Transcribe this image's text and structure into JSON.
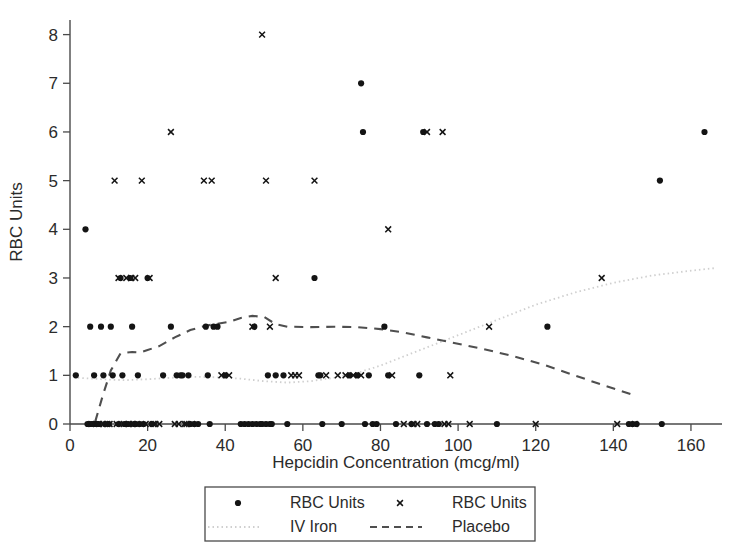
{
  "chart_data": {
    "type": "scatter",
    "title": "",
    "xlabel": "Hepcidin Concentration (mcg/ml)",
    "ylabel": "RBC Units",
    "xlim": [
      0,
      168
    ],
    "ylim": [
      0,
      8.3
    ],
    "xticks": [
      0,
      20,
      40,
      60,
      80,
      100,
      120,
      140,
      160
    ],
    "yticks": [
      0,
      1,
      2,
      3,
      4,
      5,
      6,
      7,
      8
    ],
    "grid": false,
    "legend_position": "below-center",
    "legend": [
      {
        "label": "RBC Units",
        "marker": "dot"
      },
      {
        "label": "RBC Units",
        "marker": "x"
      },
      {
        "label": "IV Iron",
        "marker": "dotted-line"
      },
      {
        "label": "Placebo",
        "marker": "dashed-line"
      }
    ],
    "series": [
      {
        "name": "RBC Units",
        "marker": "dot",
        "group": "IV Iron",
        "points": [
          [
            1.5,
            1
          ],
          [
            4.0,
            4
          ],
          [
            4.5,
            0
          ],
          [
            5.0,
            0
          ],
          [
            5.2,
            2
          ],
          [
            5.6,
            0
          ],
          [
            6.0,
            0
          ],
          [
            6.2,
            1
          ],
          [
            6.6,
            0
          ],
          [
            7.0,
            0
          ],
          [
            7.4,
            0
          ],
          [
            8.0,
            2
          ],
          [
            8.6,
            1
          ],
          [
            9.0,
            0
          ],
          [
            10.0,
            0
          ],
          [
            10.5,
            2
          ],
          [
            11.0,
            1
          ],
          [
            12.5,
            0
          ],
          [
            13.0,
            3
          ],
          [
            13.5,
            1
          ],
          [
            14.0,
            0
          ],
          [
            15.0,
            0
          ],
          [
            15.5,
            3
          ],
          [
            16.0,
            2
          ],
          [
            16.5,
            0
          ],
          [
            17.0,
            0
          ],
          [
            17.5,
            1
          ],
          [
            18.0,
            0
          ],
          [
            19.0,
            0
          ],
          [
            20.0,
            3
          ],
          [
            21.0,
            0
          ],
          [
            24.0,
            1
          ],
          [
            26.0,
            2
          ],
          [
            27.5,
            1
          ],
          [
            28.5,
            1
          ],
          [
            29.0,
            1
          ],
          [
            30.5,
            1
          ],
          [
            31.0,
            0
          ],
          [
            32.0,
            0
          ],
          [
            33.0,
            0
          ],
          [
            35.0,
            2
          ],
          [
            35.5,
            1
          ],
          [
            36.0,
            0
          ],
          [
            37.0,
            2
          ],
          [
            38.0,
            2
          ],
          [
            40.0,
            1
          ],
          [
            44.0,
            0
          ],
          [
            45.0,
            0
          ],
          [
            46.0,
            0
          ],
          [
            47.0,
            0
          ],
          [
            47.5,
            2
          ],
          [
            48.0,
            0
          ],
          [
            49.0,
            0
          ],
          [
            49.5,
            0
          ],
          [
            50.5,
            0
          ],
          [
            51.0,
            1
          ],
          [
            51.5,
            0
          ],
          [
            52.0,
            0
          ],
          [
            53.0,
            1
          ],
          [
            55.0,
            1
          ],
          [
            56.0,
            0
          ],
          [
            63.0,
            3
          ],
          [
            64.0,
            1
          ],
          [
            64.5,
            1
          ],
          [
            65.0,
            0
          ],
          [
            70.0,
            0
          ],
          [
            72.0,
            1
          ],
          [
            74.0,
            1
          ],
          [
            75.0,
            7
          ],
          [
            75.5,
            6
          ],
          [
            76.0,
            0
          ],
          [
            77.0,
            1
          ],
          [
            78.0,
            0
          ],
          [
            79.0,
            0
          ],
          [
            81.0,
            2
          ],
          [
            82.0,
            1
          ],
          [
            84.0,
            0
          ],
          [
            88.0,
            0
          ],
          [
            90.0,
            1
          ],
          [
            91.0,
            6
          ],
          [
            92.0,
            0
          ],
          [
            94.0,
            0
          ],
          [
            95.0,
            0
          ],
          [
            110.0,
            0
          ],
          [
            123.0,
            2
          ],
          [
            144.0,
            0
          ],
          [
            145.0,
            0
          ],
          [
            146.0,
            0
          ],
          [
            152.0,
            5
          ],
          [
            152.5,
            0
          ],
          [
            163.5,
            6
          ]
        ]
      },
      {
        "name": "RBC Units",
        "marker": "x",
        "group": "Placebo",
        "points": [
          [
            5.5,
            0
          ],
          [
            7.5,
            0
          ],
          [
            8.5,
            0
          ],
          [
            9.5,
            0
          ],
          [
            10.2,
            0
          ],
          [
            11.5,
            5
          ],
          [
            12.0,
            0
          ],
          [
            12.5,
            3
          ],
          [
            13.8,
            0
          ],
          [
            14.5,
            3
          ],
          [
            15.2,
            0
          ],
          [
            15.8,
            3
          ],
          [
            16.2,
            0
          ],
          [
            16.8,
            3
          ],
          [
            17.2,
            0
          ],
          [
            18.5,
            5
          ],
          [
            19.5,
            0
          ],
          [
            20.5,
            3
          ],
          [
            21.5,
            0
          ],
          [
            22.0,
            0
          ],
          [
            23.0,
            0
          ],
          [
            26.0,
            6
          ],
          [
            27.0,
            0
          ],
          [
            28.0,
            0
          ],
          [
            29.5,
            0
          ],
          [
            30.0,
            0
          ],
          [
            31.5,
            0
          ],
          [
            34.5,
            5
          ],
          [
            36.5,
            5
          ],
          [
            39.0,
            1
          ],
          [
            41.0,
            1
          ],
          [
            47.0,
            2
          ],
          [
            49.5,
            8
          ],
          [
            50.5,
            5
          ],
          [
            51.5,
            2
          ],
          [
            53.0,
            3
          ],
          [
            57.0,
            1
          ],
          [
            58.0,
            1
          ],
          [
            59.0,
            1
          ],
          [
            63.0,
            5
          ],
          [
            66.0,
            1
          ],
          [
            69.0,
            1
          ],
          [
            71.0,
            1
          ],
          [
            73.0,
            1
          ],
          [
            75.0,
            1
          ],
          [
            82.0,
            4
          ],
          [
            83.0,
            1
          ],
          [
            86.0,
            0
          ],
          [
            88.5,
            0
          ],
          [
            89.5,
            0
          ],
          [
            92.0,
            6
          ],
          [
            96.0,
            6
          ],
          [
            96.5,
            0
          ],
          [
            97.5,
            0
          ],
          [
            98.0,
            1
          ],
          [
            103.0,
            0
          ],
          [
            108.0,
            2
          ],
          [
            120.0,
            0
          ],
          [
            137.0,
            3
          ],
          [
            141.0,
            0
          ],
          [
            145.5,
            0
          ]
        ]
      }
    ],
    "trend_lines": [
      {
        "name": "IV Iron",
        "style": "dotted",
        "points": [
          [
            2,
            0.95
          ],
          [
            8,
            0.92
          ],
          [
            14,
            0.9
          ],
          [
            20,
            0.92
          ],
          [
            26,
            0.95
          ],
          [
            32,
            0.97
          ],
          [
            38,
            0.96
          ],
          [
            44,
            0.93
          ],
          [
            50,
            0.88
          ],
          [
            56,
            0.85
          ],
          [
            62,
            0.88
          ],
          [
            68,
            0.95
          ],
          [
            74,
            1.05
          ],
          [
            80,
            1.2
          ],
          [
            88,
            1.45
          ],
          [
            96,
            1.7
          ],
          [
            104,
            1.95
          ],
          [
            112,
            2.2
          ],
          [
            120,
            2.45
          ],
          [
            130,
            2.7
          ],
          [
            140,
            2.9
          ],
          [
            150,
            3.05
          ],
          [
            160,
            3.15
          ],
          [
            166,
            3.2
          ]
        ]
      },
      {
        "name": "Placebo",
        "style": "dashed",
        "points": [
          [
            6.5,
            0.05
          ],
          [
            8.5,
            0.6
          ],
          [
            10.5,
            1.1
          ],
          [
            13.0,
            1.45
          ],
          [
            16.0,
            1.48
          ],
          [
            18.0,
            1.47
          ],
          [
            20.0,
            1.52
          ],
          [
            23.0,
            1.6
          ],
          [
            27.0,
            1.78
          ],
          [
            31.0,
            1.93
          ],
          [
            35.0,
            2.02
          ],
          [
            38.0,
            2.06
          ],
          [
            41.0,
            2.1
          ],
          [
            44.0,
            2.18
          ],
          [
            47.0,
            2.22
          ],
          [
            50.0,
            2.2
          ],
          [
            53.0,
            2.05
          ],
          [
            56.0,
            2.0
          ],
          [
            62.0,
            1.99
          ],
          [
            68.0,
            2.0
          ],
          [
            74.0,
            1.99
          ],
          [
            80.0,
            1.95
          ],
          [
            86.0,
            1.88
          ],
          [
            92.0,
            1.78
          ],
          [
            98.0,
            1.68
          ],
          [
            106.0,
            1.55
          ],
          [
            114.0,
            1.4
          ],
          [
            122.0,
            1.22
          ],
          [
            130.0,
            1.0
          ],
          [
            138.0,
            0.78
          ],
          [
            145.0,
            0.6
          ]
        ]
      }
    ]
  }
}
